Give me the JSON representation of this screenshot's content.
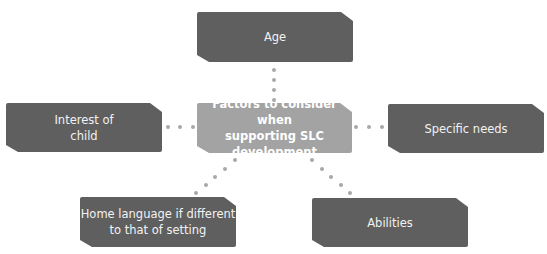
{
  "diagram": {
    "type": "mind-map",
    "center": {
      "label_line1": "Factors to consider when",
      "label_line2": "supporting SLC development"
    },
    "nodes": [
      {
        "id": "age",
        "line1": "Age",
        "line2": ""
      },
      {
        "id": "interest",
        "line1": "Interest of",
        "line2": "child"
      },
      {
        "id": "specific",
        "line1": "Specific needs",
        "line2": ""
      },
      {
        "id": "home-language",
        "line1": "Home language if different",
        "line2": "to that of setting"
      },
      {
        "id": "abilities",
        "line1": "Abilities",
        "line2": ""
      }
    ],
    "colors": {
      "node": "#5f5f5f",
      "center": "#a3a3a3",
      "connector": "#a8a8a8",
      "text": "#f2f2f2"
    }
  }
}
